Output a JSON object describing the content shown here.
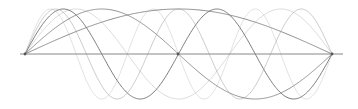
{
  "diagram": {
    "background": "#ffffff",
    "axis": {
      "x1": 20,
      "x2": 343,
      "y": 54,
      "color": "#888888"
    },
    "string": {
      "x_start": 25,
      "x_end": 332,
      "baseline_y": 54,
      "amplitude": 45
    },
    "nodes": [
      {
        "x": 25,
        "y": 54
      },
      {
        "x": 178,
        "y": 54
      },
      {
        "x": 332,
        "y": 54
      }
    ],
    "node_color": "#555555",
    "harmonics": [
      {
        "mode": 1,
        "color": "#7a7a7a",
        "opacity": 0.85
      },
      {
        "mode": 2,
        "color": "#7a7a7a",
        "opacity": 0.8
      },
      {
        "mode": 3,
        "color": "#9a9a9a",
        "opacity": 0.35
      },
      {
        "mode": 4,
        "color": "#6e6e6e",
        "opacity": 0.9
      },
      {
        "mode": 5,
        "color": "#9a9a9a",
        "opacity": 0.5
      },
      {
        "mode": 6,
        "color": "#a0a0a0",
        "opacity": 0.3
      }
    ]
  }
}
